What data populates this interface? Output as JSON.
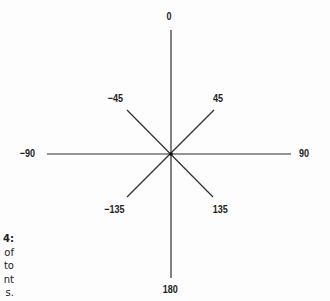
{
  "diagram": {
    "type": "compass-angle-rose",
    "center_label": "",
    "angles": [
      {
        "value": "0",
        "deg": 0
      },
      {
        "value": "45",
        "deg": 45
      },
      {
        "value": "90",
        "deg": 90
      },
      {
        "value": "135",
        "deg": 135
      },
      {
        "value": "180",
        "deg": 180
      },
      {
        "value": "-135",
        "deg": -135
      },
      {
        "value": "-90",
        "deg": -90
      },
      {
        "value": "-45",
        "deg": -45
      }
    ],
    "labels": {
      "n": "0",
      "ne": "45",
      "e": "90",
      "se": "135",
      "s": "180",
      "sw": "−135",
      "w": "−90",
      "nw": "−45"
    },
    "line_color": "#333333"
  },
  "caption_fragment": {
    "lines": [
      "4:",
      "of",
      "to",
      "nt",
      "s."
    ]
  }
}
